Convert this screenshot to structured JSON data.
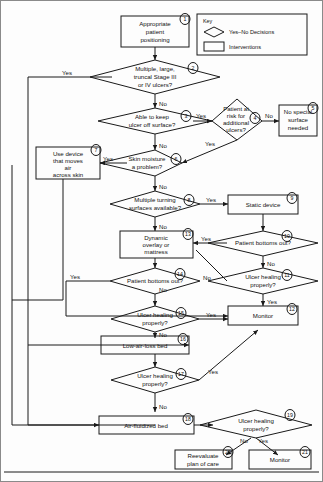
{
  "document": {
    "type": "clinical-decision-flowchart",
    "title": "Support surface selection algorithm for pressure ulcer management"
  },
  "key": {
    "heading": "Key",
    "items": [
      {
        "shape": "diamond",
        "label": "Yes–No Decisions"
      },
      {
        "shape": "rectangle",
        "label": "Interventions"
      }
    ]
  },
  "edge_labels": {
    "yes": "Yes",
    "no": "No"
  },
  "nodes": [
    {
      "id": 1,
      "shape": "rect",
      "text": "Appropriate patient positioning",
      "lines": [
        "Appropriate",
        "patient",
        "positioning"
      ]
    },
    {
      "id": 2,
      "shape": "diamond",
      "text": "Multiple, large, truncal Stage III or IV ulcers?",
      "lines": [
        "Multiple, large,",
        "truncal Stage III",
        "or IV ulcers?"
      ]
    },
    {
      "id": 3,
      "shape": "diamond",
      "text": "Able to keep ulcer off surface?",
      "lines": [
        "Able to keep",
        "ulcer off surface?"
      ]
    },
    {
      "id": 4,
      "shape": "diamond",
      "text": "Patient at risk for additional ulcers?",
      "lines": [
        "Patient at",
        "risk for",
        "additional",
        "ulcers?"
      ]
    },
    {
      "id": 5,
      "shape": "rect",
      "text": "No special surface needed",
      "lines": [
        "No special",
        "surface",
        "needed"
      ]
    },
    {
      "id": 6,
      "shape": "diamond",
      "text": "Skin moisture a problem?",
      "lines": [
        "Skin moisture",
        "a problem?"
      ]
    },
    {
      "id": 7,
      "shape": "rect",
      "text": "Use device that moves air across skin",
      "lines": [
        "Use device",
        "that moves",
        "air",
        "across skin"
      ]
    },
    {
      "id": 8,
      "shape": "diamond",
      "text": "Multiple turning surfaces available?",
      "lines": [
        "Multiple turning",
        "surfaces available?"
      ]
    },
    {
      "id": 9,
      "shape": "rect",
      "text": "Static device",
      "lines": [
        "Static device"
      ]
    },
    {
      "id": 10,
      "shape": "diamond",
      "text": "Patient bottoms out?",
      "lines": [
        "Patient bottoms out?"
      ]
    },
    {
      "id": 11,
      "shape": "diamond",
      "text": "Ulcer healing properly?",
      "lines": [
        "Ulcer healing",
        "properly?"
      ]
    },
    {
      "id": 12,
      "shape": "rect",
      "text": "Monitor",
      "lines": [
        "Monitor"
      ]
    },
    {
      "id": 13,
      "shape": "rect",
      "text": "Dynamic overlay or mattress",
      "lines": [
        "Dynamic",
        "overlay or",
        "mattress"
      ]
    },
    {
      "id": 14,
      "shape": "diamond",
      "text": "Patient bottoms out?",
      "lines": [
        "Patient bottoms out?"
      ]
    },
    {
      "id": 15,
      "shape": "diamond",
      "text": "Ulcer healing properly?",
      "lines": [
        "Ulcer healing",
        "properly?"
      ]
    },
    {
      "id": 16,
      "shape": "rect",
      "text": "Low-air-loss bed",
      "lines": [
        "Low-air-loss bed"
      ]
    },
    {
      "id": 17,
      "shape": "diamond",
      "text": "Ulcer healing properly?",
      "lines": [
        "Ulcer healing",
        "properly?"
      ]
    },
    {
      "id": 18,
      "shape": "rect",
      "text": "Air-fluidized bed",
      "lines": [
        "Air-fluidized bed"
      ]
    },
    {
      "id": 19,
      "shape": "diamond",
      "text": "Ulcer healing properly?",
      "lines": [
        "Ulcer healing",
        "properly?"
      ]
    },
    {
      "id": 20,
      "shape": "rect",
      "text": "Reevaluate plan of care",
      "lines": [
        "Reevaluate",
        "plan of care"
      ]
    },
    {
      "id": 21,
      "shape": "rect",
      "text": "Monitor",
      "lines": [
        "Monitor"
      ]
    }
  ],
  "edges": [
    {
      "from": 1,
      "to": 2,
      "label": ""
    },
    {
      "from": 2,
      "to": 16,
      "label": "Yes"
    },
    {
      "from": 2,
      "to": 3,
      "label": "No"
    },
    {
      "from": 3,
      "to": 4,
      "label": "Yes"
    },
    {
      "from": 3,
      "to": 6,
      "label": "No"
    },
    {
      "from": 4,
      "to": 5,
      "label": "No"
    },
    {
      "from": 4,
      "to": 6,
      "label": "Yes"
    },
    {
      "from": 6,
      "to": 7,
      "label": "Yes"
    },
    {
      "from": 6,
      "to": 8,
      "label": "No"
    },
    {
      "from": 8,
      "to": 9,
      "label": "Yes"
    },
    {
      "from": 8,
      "to": 13,
      "label": "No"
    },
    {
      "from": 9,
      "to": 10,
      "label": ""
    },
    {
      "from": 10,
      "to": 13,
      "label": "Yes"
    },
    {
      "from": 10,
      "to": 11,
      "label": "No"
    },
    {
      "from": 11,
      "to": 12,
      "label": "Yes"
    },
    {
      "from": 11,
      "to": 14,
      "label": "No"
    },
    {
      "from": 13,
      "to": 14,
      "label": ""
    },
    {
      "from": 14,
      "to": 15,
      "label": "No"
    },
    {
      "from": 14,
      "to": 12,
      "label": "Yes"
    },
    {
      "from": 15,
      "to": 12,
      "label": "Yes"
    },
    {
      "from": 15,
      "to": 16,
      "label": "No"
    },
    {
      "from": 16,
      "to": 17,
      "label": ""
    },
    {
      "from": 17,
      "to": 12,
      "label": "Yes"
    },
    {
      "from": 17,
      "to": 18,
      "label": "No"
    },
    {
      "from": 18,
      "to": 19,
      "label": ""
    },
    {
      "from": 19,
      "to": 20,
      "label": "No"
    },
    {
      "from": 19,
      "to": 21,
      "label": "Yes"
    }
  ]
}
